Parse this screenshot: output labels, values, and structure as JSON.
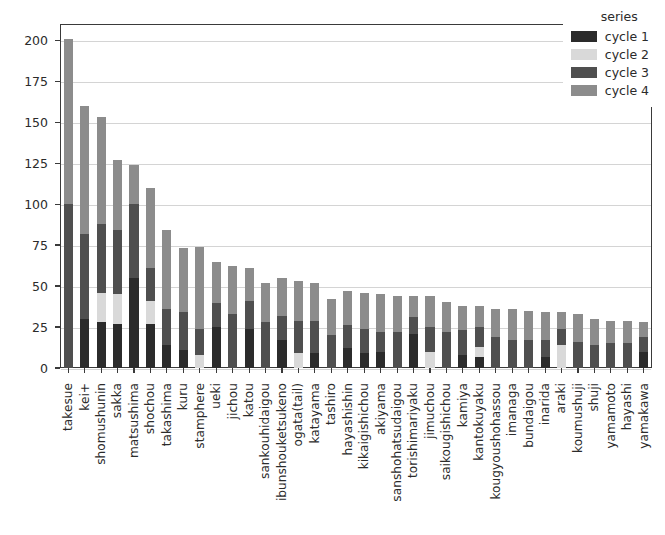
{
  "chart_data": {
    "type": "bar",
    "subtype": "stacked-bar",
    "title": "",
    "xlabel": "",
    "ylabel": "",
    "ylim": [
      0,
      210
    ],
    "yticks": [
      0,
      25,
      50,
      75,
      100,
      125,
      150,
      175,
      200
    ],
    "ytick_labels": [
      "0",
      "25",
      "50",
      "75",
      "100",
      "125",
      "150",
      "175",
      "200"
    ],
    "grid": true,
    "legend": {
      "title": "series",
      "position": "upper right",
      "entries": [
        {
          "name": "cycle 1",
          "color": "#2b2b2b"
        },
        {
          "name": "cycle 2",
          "color": "#d9d9d9"
        },
        {
          "name": "cycle 3",
          "color": "#4f4f4f"
        },
        {
          "name": "cycle 4",
          "color": "#8c8c8c"
        }
      ]
    },
    "categories": [
      "takesue",
      "kei+",
      "shomushunin",
      "sakka",
      "matsushima",
      "shochou",
      "takashima",
      "kuru",
      "stamphere",
      "ueki",
      "jichou",
      "katou",
      "sankouhidaigou",
      "ibunshouketsukeno",
      "ogata(tail)",
      "katayama",
      "tashiro",
      "hayashishin",
      "kikaigishichou",
      "akiyama",
      "sanshohatsudaigou",
      "torishimariyaku",
      "jimuchou",
      "saikougishichou",
      "kamiya",
      "kantokuyaku",
      "kougyoushohassou",
      "imanaga",
      "bundaigou",
      "inarida",
      "araki",
      "koumushuji",
      "shuji",
      "yamamoto",
      "hayashi",
      "yamakawa"
    ],
    "series": [
      {
        "name": "cycle 1",
        "color": "#2b2b2b",
        "values": [
          0,
          30,
          28,
          27,
          55,
          27,
          14,
          11,
          0,
          25,
          0,
          24,
          0,
          17,
          0,
          9,
          0,
          12,
          9,
          10,
          0,
          21,
          0,
          0,
          8,
          7,
          0,
          0,
          0,
          7,
          0,
          0,
          0,
          0,
          0,
          10
        ]
      },
      {
        "name": "cycle 2",
        "color": "#d9d9d9",
        "values": [
          0,
          0,
          18,
          18,
          0,
          14,
          0,
          0,
          8,
          0,
          0,
          0,
          0,
          0,
          9,
          0,
          0,
          0,
          0,
          0,
          0,
          0,
          10,
          0,
          0,
          6,
          0,
          0,
          0,
          0,
          14,
          0,
          0,
          0,
          0,
          0
        ]
      },
      {
        "name": "cycle 3",
        "color": "#4f4f4f",
        "values": [
          100,
          52,
          42,
          39,
          45,
          20,
          22,
          23,
          16,
          15,
          33,
          17,
          28,
          15,
          20,
          20,
          20,
          14,
          15,
          12,
          22,
          10,
          15,
          22,
          15,
          12,
          19,
          17,
          17,
          10,
          10,
          16,
          14,
          15,
          15,
          9
        ]
      },
      {
        "name": "cycle 4",
        "color": "#8c8c8c",
        "values": [
          101,
          78,
          65,
          43,
          24,
          49,
          48,
          39,
          50,
          25,
          29,
          20,
          24,
          23,
          24,
          23,
          22,
          21,
          22,
          23,
          22,
          13,
          19,
          18,
          15,
          13,
          17,
          19,
          18,
          17,
          10,
          17,
          16,
          14,
          14,
          9
        ]
      }
    ]
  }
}
